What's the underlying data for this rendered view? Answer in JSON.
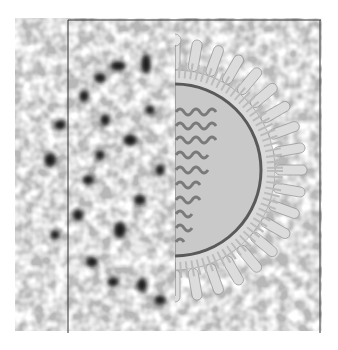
{
  "figure": {
    "colors": {
      "background": "#ffffff",
      "micrograph_mid": "#b8b8b8",
      "micrograph_dark": "#1a1a1a",
      "micrograph_light": "#e6e6e6",
      "frame_line": "#333333",
      "schematic_fill": "#c9c9c9",
      "schematic_spike": "#dcdcdc",
      "membrane_dark": "#5a5a5a",
      "nucleocapsid": "#7a7a7a"
    },
    "schematic": {
      "spike_count": 22,
      "nucleocapsid_rows": 10
    }
  }
}
